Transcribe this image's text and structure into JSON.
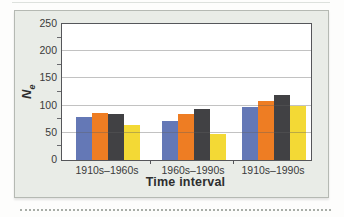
{
  "chart_data": {
    "type": "bar",
    "title": "",
    "categories": [
      "1910s–1960s",
      "1960s–1990s",
      "1910s–1990s"
    ],
    "series": [
      {
        "name": "blue",
        "color": "#6478b6",
        "values": [
          80,
          72,
          97
        ]
      },
      {
        "name": "orange",
        "color": "#ee7d23",
        "values": [
          87,
          84,
          108
        ]
      },
      {
        "name": "dark-gray",
        "color": "#414144",
        "values": [
          84,
          93,
          119
        ]
      },
      {
        "name": "yellow",
        "color": "#f3d935",
        "values": [
          64,
          48,
          100
        ]
      }
    ],
    "xlabel": "Time interval",
    "ylabel_base": "N",
    "ylabel_sub": "e",
    "ylim": [
      0,
      250
    ],
    "yticks": [
      0,
      50,
      100,
      150,
      200,
      250
    ],
    "minor_ytick_interval": 25,
    "grid": "horizontal",
    "gridlines_over_bars": true,
    "legend": "none"
  },
  "page": {
    "card_bg": "#e9ece7",
    "plot_bg": "#ffffff",
    "plot_border": "#55565a",
    "text_color": "#3a3a3a"
  }
}
